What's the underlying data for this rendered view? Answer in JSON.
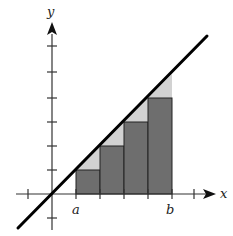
{
  "diagram": {
    "type": "left-endpoint Riemann sum under line y = x",
    "axes": {
      "x_label": "x",
      "y_label": "y"
    },
    "interval_labels": {
      "a": "a",
      "b": "b"
    },
    "origin_px": [
      52,
      194
    ],
    "unit_px": 24,
    "x_ticks": [
      -1,
      1,
      2,
      3,
      4,
      5,
      6
    ],
    "y_ticks": [
      -1,
      1,
      2,
      3,
      4,
      5,
      6
    ],
    "line": {
      "equation": "y = x",
      "from": [
        -1.33,
        -1.33
      ],
      "to": [
        6.5,
        6.5
      ],
      "color": "#000000"
    },
    "rectangles": [
      {
        "x0": 1,
        "x1": 2,
        "height": 1
      },
      {
        "x0": 2,
        "x1": 3,
        "height": 2
      },
      {
        "x0": 3,
        "x1": 4,
        "height": 3
      },
      {
        "x0": 4,
        "x1": 5,
        "height": 4
      }
    ],
    "colors": {
      "rectangle_fill": "#6e6e6e",
      "gap_triangle_fill": "#d2d2d2",
      "axis": "#333333",
      "line": "#000000"
    }
  }
}
